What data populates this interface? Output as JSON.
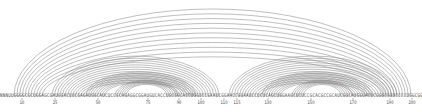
{
  "diagram": {
    "type": "arc-diagram",
    "background_color": "#ffffff",
    "arc_color": "#8a8a8a",
    "sequence_color": "#4a4a4a",
    "tick_color": "#3a3a3a",
    "length": 225,
    "baseline_y": 96
  },
  "sequence": {
    "label": "nucleotide-sequence",
    "text": "NNNUUGGGGCGCUGGAGCGAUGGACUUCGAGAUGGCAUCUCCGCAGAGGCGGAUGUCACCUGCGGCACCUGGUCCGAAUCGGAACCGGAAUCCUCUCAGCUGGAAGCUCUCCGCACGCCGCAUCGGCAUGGGACUCGGGCGGUCCCCUGGCGGAGCAGGCAGGAGCGCCUCCAACG"
  },
  "ticks": {
    "label": "position-axis",
    "items": [
      {
        "position": 10,
        "label": "10",
        "x_px": 22
      },
      {
        "position": 25,
        "label": "25",
        "x_px": 55
      },
      {
        "position": 50,
        "label": "50",
        "x_px": 98
      },
      {
        "position": 75,
        "label": "75",
        "x_px": 148
      },
      {
        "position": 90,
        "label": "90",
        "x_px": 179
      },
      {
        "position": 100,
        "label": "100",
        "x_px": 201
      },
      {
        "position": 110,
        "label": "110",
        "x_px": 224
      },
      {
        "position": 115,
        "label": "115",
        "x_px": 237
      },
      {
        "position": 130,
        "label": "130",
        "x_px": 268
      },
      {
        "position": 150,
        "label": "150",
        "x_px": 311
      },
      {
        "position": 170,
        "label": "170",
        "x_px": 353
      },
      {
        "position": 190,
        "label": "190",
        "x_px": 390
      },
      {
        "position": 200,
        "label": "200",
        "x_px": 412
      }
    ]
  },
  "chart_data": {
    "type": "arc-diagram",
    "xlabel": "sequence position",
    "ylabel": "",
    "xlim": [
      0,
      422
    ],
    "grid": false,
    "legend": "none",
    "baseline_y": 96,
    "arc_color": "#8a8a8a",
    "arc_families": [
      {
        "name": "outer-long-range-helix",
        "count": 11,
        "left_start": 14,
        "right_start": 411,
        "step": 2.8,
        "height_top": 9
      },
      {
        "name": "left-domain-outer-helix",
        "count": 13,
        "left_start": 52,
        "right_start": 219,
        "step": 2.6,
        "height_top": 56
      },
      {
        "name": "left-domain-inner-helix",
        "count": 9,
        "left_start": 86,
        "right_start": 196,
        "step": 2.3,
        "height_top": 72
      },
      {
        "name": "left-domain-stem-loop",
        "count": 6,
        "left_start": 115,
        "right_start": 178,
        "step": 2.2,
        "height_top": 80
      },
      {
        "name": "right-domain-outer-helix",
        "count": 13,
        "left_start": 229,
        "right_start": 397,
        "step": 2.6,
        "height_top": 56
      },
      {
        "name": "right-domain-inner-helix",
        "count": 9,
        "left_start": 262,
        "right_start": 372,
        "step": 2.3,
        "height_top": 72
      },
      {
        "name": "right-domain-stem-loop",
        "count": 6,
        "left_start": 292,
        "right_start": 352,
        "step": 2.2,
        "height_top": 80
      }
    ]
  }
}
